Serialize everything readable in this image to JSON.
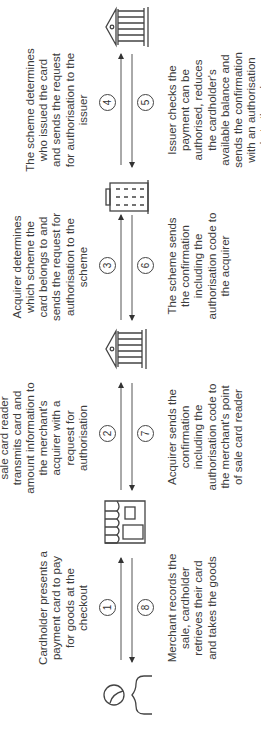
{
  "diagram": {
    "orientation": "rotated-90-ccw",
    "colors": {
      "stroke": "#444444",
      "text": "#3c3c3c",
      "background": "#ffffff"
    },
    "actors": [
      {
        "id": "cardholder",
        "icon": "person-icon"
      },
      {
        "id": "merchant",
        "icon": "shop-icon"
      },
      {
        "id": "acquirer",
        "icon": "bank-icon"
      },
      {
        "id": "scheme",
        "icon": "office-building-icon"
      },
      {
        "id": "issuer",
        "icon": "bank-icon"
      }
    ],
    "steps": [
      {
        "num": "1",
        "from": "cardholder",
        "to": "merchant",
        "text": "Cardholder presents a payment card to pay for goods at the checkout"
      },
      {
        "num": "2",
        "from": "merchant",
        "to": "acquirer",
        "text": "Merchant's point of sale card reader transmits card and amount information to the merchant's acquirer with a request for authorisation"
      },
      {
        "num": "3",
        "from": "acquirer",
        "to": "scheme",
        "text": "Acquirer determines which scheme the card belongs to and sends the request for authorisation to the scheme"
      },
      {
        "num": "4",
        "from": "scheme",
        "to": "issuer",
        "text": "The scheme determines who issued the card and sends the request for authorisation to the issuer"
      },
      {
        "num": "5",
        "from": "issuer",
        "to": "scheme",
        "text": "Issuer checks the payment can be authorised, reduces the cardholder's available balance and sends the confirmation with an authorisation code to the scheme"
      },
      {
        "num": "6",
        "from": "scheme",
        "to": "acquirer",
        "text": "The scheme sends the confirmation including the authorisation code to the acquirer"
      },
      {
        "num": "7",
        "from": "acquirer",
        "to": "merchant",
        "text": "Acquirer sends the confirmation including the authorisation code to the merchant's point of sale card reader"
      },
      {
        "num": "8",
        "from": "merchant",
        "to": "cardholder",
        "text": "Merchant records the sale, cardholder retrieves their card and takes the goods"
      }
    ]
  }
}
